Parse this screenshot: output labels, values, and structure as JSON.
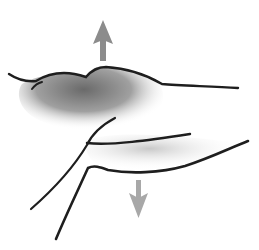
{
  "figure": {
    "arrows": [
      {
        "name": "up-arrow",
        "direction": "up",
        "color": "#8c8c8c"
      },
      {
        "name": "down-arrow",
        "direction": "down",
        "color": "#a8a8a8"
      }
    ],
    "line_color": "#1e1e1e",
    "shade_color": "#6e6e6e"
  }
}
